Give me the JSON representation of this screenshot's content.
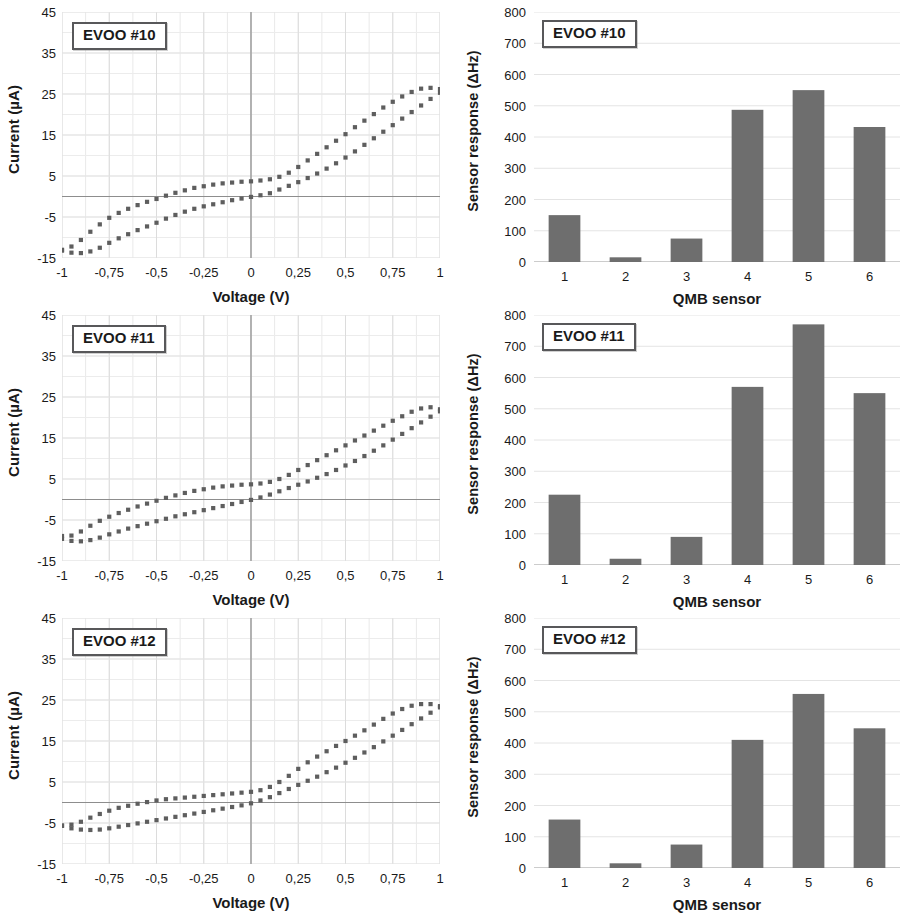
{
  "figure": {
    "panel_count": 6,
    "rows": 3,
    "columns": 2
  },
  "rows": [
    {
      "sample": "EVOO #10",
      "cv_label": "EVOO #10",
      "bar_label": "EVOO #10"
    },
    {
      "sample": "EVOO #11",
      "cv_label": "EVOO #11",
      "bar_label": "EVOO #11"
    },
    {
      "sample": "EVOO #12",
      "cv_label": "EVOO #12",
      "bar_label": "EVOO #12"
    }
  ],
  "chart_data": [
    {
      "type": "scatter",
      "title": "EVOO #10",
      "xlabel": "Voltage (V)",
      "ylabel": "Current (µA)",
      "xlim": [
        -1,
        1
      ],
      "ylim": [
        -15,
        45
      ],
      "xticks": [
        -1,
        -0.75,
        -0.5,
        -0.25,
        0,
        0.25,
        0.5,
        0.75,
        1
      ],
      "xticklabels": [
        "-1",
        "-0,75",
        "-0,5",
        "-0,25",
        "0",
        "0,25",
        "0,5",
        "0,75",
        "1"
      ],
      "yticks": [
        -15,
        -5,
        5,
        15,
        25,
        35,
        45
      ],
      "yticklabels": [
        "-15",
        "-5",
        "5",
        "15",
        "25",
        "35",
        "45"
      ],
      "grid": true,
      "legend": "none",
      "series": [
        {
          "name": "forward sweep",
          "x": [
            -1.0,
            -0.95,
            -0.9,
            -0.85,
            -0.8,
            -0.75,
            -0.7,
            -0.65,
            -0.6,
            -0.55,
            -0.5,
            -0.45,
            -0.4,
            -0.35,
            -0.3,
            -0.25,
            -0.2,
            -0.15,
            -0.1,
            -0.05,
            0.0,
            0.05,
            0.1,
            0.15,
            0.2,
            0.25,
            0.3,
            0.35,
            0.4,
            0.45,
            0.5,
            0.55,
            0.6,
            0.65,
            0.7,
            0.75,
            0.8,
            0.85,
            0.9,
            0.95,
            1.0
          ],
          "y": [
            -13.0,
            -12.2,
            -10.6,
            -8.6,
            -6.8,
            -5.2,
            -4.0,
            -3.0,
            -2.1,
            -1.3,
            -0.6,
            0.2,
            0.9,
            1.5,
            2.1,
            2.5,
            2.9,
            3.2,
            3.4,
            3.6,
            3.7,
            3.9,
            4.2,
            4.8,
            5.8,
            7.2,
            8.8,
            10.4,
            12.0,
            13.6,
            15.2,
            16.9,
            18.5,
            20.1,
            21.7,
            23.1,
            24.4,
            25.5,
            26.3,
            26.5,
            26.2
          ]
        },
        {
          "name": "reverse sweep",
          "x": [
            1.0,
            0.95,
            0.9,
            0.85,
            0.8,
            0.75,
            0.7,
            0.65,
            0.6,
            0.55,
            0.5,
            0.45,
            0.4,
            0.35,
            0.3,
            0.25,
            0.2,
            0.15,
            0.1,
            0.05,
            0.0,
            -0.05,
            -0.1,
            -0.15,
            -0.2,
            -0.25,
            -0.3,
            -0.35,
            -0.4,
            -0.45,
            -0.5,
            -0.55,
            -0.6,
            -0.65,
            -0.7,
            -0.75,
            -0.8,
            -0.85,
            -0.9,
            -0.95,
            -1.0
          ],
          "y": [
            25.3,
            23.8,
            22.2,
            20.6,
            19.0,
            17.4,
            15.8,
            14.2,
            12.6,
            11.0,
            9.5,
            8.1,
            6.8,
            5.6,
            4.5,
            3.5,
            2.6,
            1.7,
            0.8,
            0.3,
            -0.1,
            -0.5,
            -0.9,
            -1.4,
            -1.9,
            -2.4,
            -3.0,
            -3.7,
            -4.5,
            -5.4,
            -6.4,
            -7.3,
            -8.2,
            -9.2,
            -10.2,
            -11.3,
            -12.5,
            -13.4,
            -13.8,
            -13.7,
            -13.2
          ]
        }
      ]
    },
    {
      "type": "bar",
      "title": "EVOO #10",
      "xlabel": "QMB sensor",
      "ylabel": "Sensor response (ΔHz)",
      "categories": [
        "1",
        "2",
        "3",
        "4",
        "5",
        "6"
      ],
      "values": [
        150,
        15,
        75,
        487,
        550,
        432
      ],
      "ylim": [
        0,
        800
      ],
      "yticks": [
        0,
        100,
        200,
        300,
        400,
        500,
        600,
        700,
        800
      ],
      "grid": true,
      "legend": "none",
      "bar_color": "#6e6e6e"
    },
    {
      "type": "scatter",
      "title": "EVOO #11",
      "xlabel": "Voltage (V)",
      "ylabel": "Current (µA)",
      "xlim": [
        -1,
        1
      ],
      "ylim": [
        -15,
        45
      ],
      "xticks": [
        -1,
        -0.75,
        -0.5,
        -0.25,
        0,
        0.25,
        0.5,
        0.75,
        1
      ],
      "xticklabels": [
        "-1",
        "-0,75",
        "-0,5",
        "-0,25",
        "0",
        "0,25",
        "0,5",
        "0,75",
        "1"
      ],
      "yticks": [
        -15,
        -5,
        5,
        15,
        25,
        35,
        45
      ],
      "yticklabels": [
        "-15",
        "-5",
        "5",
        "15",
        "25",
        "35",
        "45"
      ],
      "grid": true,
      "legend": "none",
      "series": [
        {
          "name": "forward sweep",
          "x": [
            -1.0,
            -0.95,
            -0.9,
            -0.85,
            -0.8,
            -0.75,
            -0.7,
            -0.65,
            -0.6,
            -0.55,
            -0.5,
            -0.45,
            -0.4,
            -0.35,
            -0.3,
            -0.25,
            -0.2,
            -0.15,
            -0.1,
            -0.05,
            0.0,
            0.05,
            0.1,
            0.15,
            0.2,
            0.25,
            0.3,
            0.35,
            0.4,
            0.45,
            0.5,
            0.55,
            0.6,
            0.65,
            0.7,
            0.75,
            0.8,
            0.85,
            0.9,
            0.95,
            1.0
          ],
          "y": [
            -8.9,
            -8.8,
            -7.8,
            -6.4,
            -5.2,
            -4.2,
            -3.3,
            -2.5,
            -1.7,
            -1.0,
            -0.3,
            0.4,
            1.0,
            1.6,
            2.1,
            2.5,
            2.9,
            3.2,
            3.4,
            3.6,
            3.7,
            3.9,
            4.3,
            5.0,
            6.0,
            7.2,
            8.4,
            9.6,
            10.8,
            12.0,
            13.2,
            14.4,
            15.6,
            16.8,
            18.0,
            19.2,
            20.3,
            21.4,
            22.2,
            22.5,
            22.0
          ]
        },
        {
          "name": "reverse sweep",
          "x": [
            1.0,
            0.95,
            0.9,
            0.85,
            0.8,
            0.75,
            0.7,
            0.65,
            0.6,
            0.55,
            0.5,
            0.45,
            0.4,
            0.35,
            0.3,
            0.25,
            0.2,
            0.15,
            0.1,
            0.05,
            0.0,
            -0.05,
            -0.1,
            -0.15,
            -0.2,
            -0.25,
            -0.3,
            -0.35,
            -0.4,
            -0.45,
            -0.5,
            -0.55,
            -0.6,
            -0.65,
            -0.7,
            -0.75,
            -0.8,
            -0.85,
            -0.9,
            -0.95,
            -1.0
          ],
          "y": [
            21.5,
            20.2,
            18.8,
            17.4,
            16.0,
            14.6,
            13.2,
            11.9,
            10.6,
            9.4,
            8.3,
            7.2,
            6.2,
            5.3,
            4.4,
            3.6,
            2.8,
            2.0,
            1.2,
            0.5,
            -0.1,
            -0.6,
            -1.1,
            -1.6,
            -2.1,
            -2.6,
            -3.1,
            -3.6,
            -4.1,
            -4.7,
            -5.3,
            -5.9,
            -6.5,
            -7.1,
            -7.8,
            -8.5,
            -9.3,
            -9.9,
            -10.2,
            -10.1,
            -9.6
          ]
        }
      ]
    },
    {
      "type": "bar",
      "title": "EVOO #11",
      "xlabel": "QMB sensor",
      "ylabel": "Sensor response (ΔHz)",
      "categories": [
        "1",
        "2",
        "3",
        "4",
        "5",
        "6"
      ],
      "values": [
        225,
        20,
        90,
        570,
        770,
        550
      ],
      "ylim": [
        0,
        800
      ],
      "yticks": [
        0,
        100,
        200,
        300,
        400,
        500,
        600,
        700,
        800
      ],
      "grid": true,
      "legend": "none",
      "bar_color": "#6e6e6e"
    },
    {
      "type": "scatter",
      "title": "EVOO #12",
      "xlabel": "Voltage (V)",
      "ylabel": "Current (µA)",
      "xlim": [
        -1,
        1
      ],
      "ylim": [
        -15,
        45
      ],
      "xticks": [
        -1,
        -0.75,
        -0.5,
        -0.25,
        0,
        0.25,
        0.5,
        0.75,
        1
      ],
      "xticklabels": [
        "-1",
        "-0,75",
        "-0,5",
        "-0,25",
        "0",
        "0,25",
        "0,5",
        "0,75",
        "1"
      ],
      "yticks": [
        -15,
        -5,
        5,
        15,
        25,
        35,
        45
      ],
      "yticklabels": [
        "-15",
        "-5",
        "5",
        "15",
        "25",
        "35",
        "45"
      ],
      "grid": true,
      "legend": "none",
      "series": [
        {
          "name": "forward sweep",
          "x": [
            -1.0,
            -0.95,
            -0.9,
            -0.85,
            -0.8,
            -0.75,
            -0.7,
            -0.65,
            -0.6,
            -0.55,
            -0.5,
            -0.45,
            -0.4,
            -0.35,
            -0.3,
            -0.25,
            -0.2,
            -0.15,
            -0.1,
            -0.05,
            0.0,
            0.05,
            0.1,
            0.15,
            0.2,
            0.25,
            0.3,
            0.35,
            0.4,
            0.45,
            0.5,
            0.55,
            0.6,
            0.65,
            0.7,
            0.75,
            0.8,
            0.85,
            0.9,
            0.95,
            1.0
          ],
          "y": [
            -5.6,
            -5.4,
            -4.7,
            -3.7,
            -2.8,
            -2.0,
            -1.3,
            -0.8,
            -0.3,
            0.1,
            0.5,
            0.8,
            1.0,
            1.2,
            1.4,
            1.6,
            1.8,
            2.0,
            2.2,
            2.4,
            2.6,
            3.0,
            3.8,
            5.0,
            6.5,
            8.2,
            9.8,
            11.2,
            12.5,
            13.8,
            15.0,
            16.3,
            17.6,
            19.0,
            20.4,
            21.7,
            22.8,
            23.6,
            24.0,
            24.0,
            23.5
          ]
        },
        {
          "name": "reverse sweep",
          "x": [
            1.0,
            0.95,
            0.9,
            0.85,
            0.8,
            0.75,
            0.7,
            0.65,
            0.6,
            0.55,
            0.5,
            0.45,
            0.4,
            0.35,
            0.3,
            0.25,
            0.2,
            0.15,
            0.1,
            0.05,
            0.0,
            -0.05,
            -0.1,
            -0.15,
            -0.2,
            -0.25,
            -0.3,
            -0.35,
            -0.4,
            -0.45,
            -0.5,
            -0.55,
            -0.6,
            -0.65,
            -0.7,
            -0.75,
            -0.8,
            -0.85,
            -0.9,
            -0.95,
            -1.0
          ],
          "y": [
            23.2,
            21.9,
            20.5,
            19.1,
            17.7,
            16.3,
            14.9,
            13.5,
            12.2,
            10.9,
            9.7,
            8.5,
            7.4,
            6.3,
            5.3,
            4.3,
            3.3,
            2.3,
            1.3,
            0.5,
            -0.2,
            -0.7,
            -1.1,
            -1.5,
            -1.9,
            -2.3,
            -2.7,
            -3.1,
            -3.5,
            -3.9,
            -4.3,
            -4.7,
            -5.1,
            -5.5,
            -5.9,
            -6.3,
            -6.6,
            -6.7,
            -6.6,
            -6.3,
            -5.7
          ]
        }
      ]
    },
    {
      "type": "bar",
      "title": "EVOO #12",
      "xlabel": "QMB sensor",
      "ylabel": "Sensor response (ΔHz)",
      "categories": [
        "1",
        "2",
        "3",
        "4",
        "5",
        "6"
      ],
      "values": [
        155,
        15,
        75,
        410,
        557,
        447
      ],
      "ylim": [
        0,
        800
      ],
      "yticks": [
        0,
        100,
        200,
        300,
        400,
        500,
        600,
        700,
        800
      ],
      "grid": true,
      "legend": "none",
      "bar_color": "#6e6e6e"
    }
  ]
}
